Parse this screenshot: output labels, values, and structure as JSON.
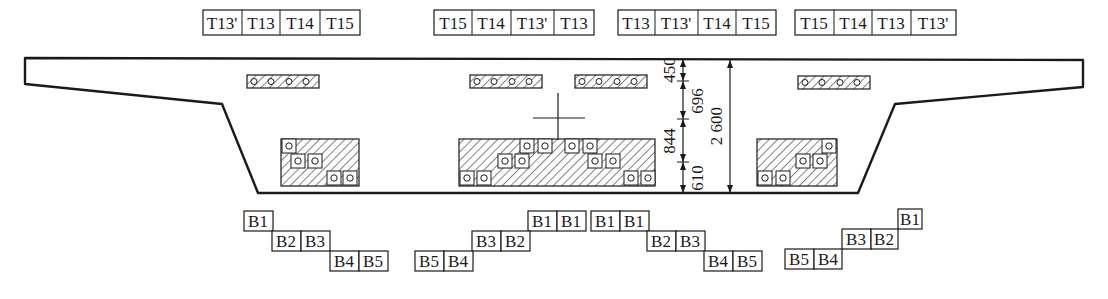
{
  "figure": {
    "type": "box-girder cross-section tendon layout",
    "top_tendon_groups": [
      {
        "id": "top-group-1",
        "labels": [
          "T13'",
          "T13",
          "T14",
          "T15"
        ],
        "x": 203,
        "y": 8
      },
      {
        "id": "top-group-2",
        "labels": [
          "T15",
          "T14",
          "T13'",
          "T13"
        ],
        "x": 434,
        "y": 8
      },
      {
        "id": "top-group-3",
        "labels": [
          "T13",
          "T13'",
          "T14",
          "T15"
        ],
        "x": 618,
        "y": 8
      },
      {
        "id": "top-group-4",
        "labels": [
          "T15",
          "T14",
          "T13",
          "T13'"
        ],
        "x": 795,
        "y": 8
      }
    ],
    "bottom_tendon_groups": [
      {
        "id": "bottom-group-1",
        "rows": [
          {
            "labels": [
              "B1"
            ],
            "x": 244,
            "y": 211
          },
          {
            "labels": [
              "B2",
              "B3"
            ],
            "x": 272,
            "y": 231
          },
          {
            "labels": [
              "B4",
              "B5"
            ],
            "x": 330,
            "y": 251
          }
        ]
      },
      {
        "id": "bottom-group-2",
        "rows": [
          {
            "labels": [
              "B1",
              "B1"
            ],
            "x": 528,
            "y": 211
          },
          {
            "labels": [
              "B3",
              "B2"
            ],
            "x": 472,
            "y": 231
          },
          {
            "labels": [
              "B5",
              "B4"
            ],
            "x": 415,
            "y": 251
          }
        ]
      },
      {
        "id": "bottom-group-3",
        "rows": [
          {
            "labels": [
              "B1",
              "B1"
            ],
            "x": 591,
            "y": 211
          },
          {
            "labels": [
              "B2",
              "B3"
            ],
            "x": 647,
            "y": 231
          },
          {
            "labels": [
              "B4",
              "B5"
            ],
            "x": 704,
            "y": 251
          }
        ]
      },
      {
        "id": "bottom-group-4",
        "rows": [
          {
            "labels": [
              "B1"
            ],
            "x": 898,
            "y": 211
          },
          {
            "labels": [
              "B3",
              "B2"
            ],
            "x": 842,
            "y": 231
          },
          {
            "labels": [
              "B5",
              "B4"
            ],
            "x": 785,
            "y": 251
          }
        ]
      }
    ],
    "dimensions": {
      "segments": [
        "450",
        "696",
        "844",
        "610"
      ],
      "total": "2 600"
    },
    "colors": {
      "line": "#1a1a1a",
      "background": "#ffffff"
    }
  }
}
